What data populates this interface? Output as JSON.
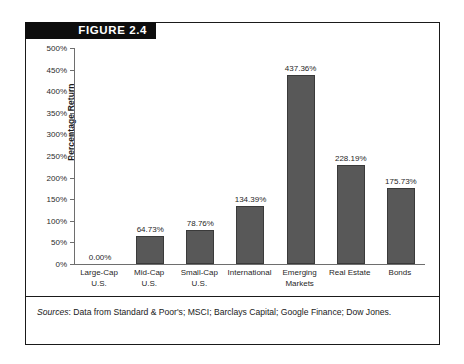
{
  "figure": {
    "banner_label": "FIGURE 2.4"
  },
  "source": {
    "label": "Sources",
    "separator": ": ",
    "text": "Data from Standard & Poor's; MSCI; Barclays Capital; Google Finance; Dow Jones."
  },
  "chart_data": {
    "type": "bar",
    "title": "FIGURE 2.4",
    "xlabel": "",
    "ylabel": "Percentage Return",
    "ylim": [
      0,
      500
    ],
    "ytick_labels": [
      "0%",
      "50%",
      "100%",
      "150%",
      "200%",
      "250%",
      "300%",
      "350%",
      "400%",
      "450%",
      "500%"
    ],
    "ytick_values": [
      0,
      50,
      100,
      150,
      200,
      250,
      300,
      350,
      400,
      450,
      500
    ],
    "grid": false,
    "legend": "none",
    "categories": [
      "Large-Cap U.S.",
      "Mid-Cap U.S.",
      "Small-Cap U.S.",
      "International",
      "Emerging Markets",
      "Real Estate",
      "Bonds"
    ],
    "category_lines": [
      [
        "Large-Cap",
        "U.S."
      ],
      [
        "Mid-Cap",
        "U.S."
      ],
      [
        "Small-Cap",
        "U.S."
      ],
      [
        "International"
      ],
      [
        "Emerging",
        "Markets"
      ],
      [
        "Real Estate"
      ],
      [
        "Bonds"
      ]
    ],
    "values": [
      0.0,
      64.73,
      78.76,
      134.39,
      437.36,
      228.19,
      175.73
    ],
    "value_labels": [
      "0.00%",
      "64.73%",
      "78.76%",
      "134.39%",
      "437.36%",
      "228.19%",
      "175.73%"
    ],
    "bar_color": "#585858",
    "bar_edge_color": "#3a3a3a",
    "axis_color": "#6e6e6e",
    "text_color": "#1f1f1f"
  }
}
